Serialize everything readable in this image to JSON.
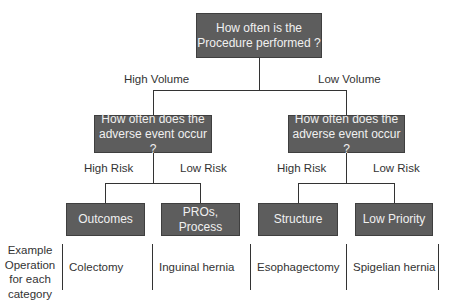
{
  "root": {
    "text_line1": "How often is  the",
    "text_line2": "Procedure performed ?"
  },
  "branches": {
    "high_volume": "High Volume",
    "low_volume": "Low Volume"
  },
  "left_question": {
    "line1": "How often does the",
    "line2": "adverse event occur ?"
  },
  "right_question": {
    "line1": "How often does the",
    "line2": "adverse event occur ?"
  },
  "risk_labels": {
    "left_high": "High Risk",
    "left_low": "Low Risk",
    "right_high": "High Risk",
    "right_low": "Low Risk"
  },
  "categories": [
    "Outcomes",
    "PROs, Process",
    "Structure",
    "Low Priority"
  ],
  "example_label": {
    "line1": "Example",
    "line2": "Operation",
    "line3": "for each",
    "line4": "category"
  },
  "examples": [
    "Colectomy",
    "Inguinal hernia",
    "Esophagectomy",
    "Spigelian hernia"
  ],
  "colors": {
    "box_fill": "#5d5d5d",
    "box_text": "#f0f0f0",
    "line": "#333333"
  }
}
